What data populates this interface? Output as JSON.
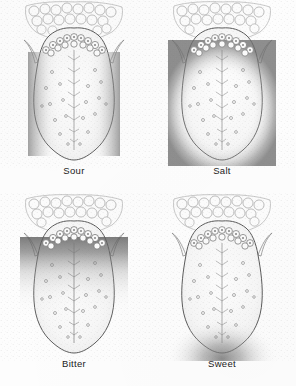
{
  "figure": {
    "background_color": "#fdfdfd",
    "ink_color": "#3a3a3a",
    "label_color": "#1b1b1b",
    "layout": "2x2 grid of dorsal tongue illustrations",
    "panel_count": 4
  },
  "panels": [
    {
      "id": "sour",
      "label": "Sour",
      "shaded_region": "lateral margins (both sides, mid-tongue)",
      "shade_color": "#8f8f8f",
      "position": "top-left"
    },
    {
      "id": "salt",
      "label": "Salt",
      "shaded_region": "anterior perimeter: lateral edges and tip",
      "shade_color": "#8f8f8f",
      "position": "top-right"
    },
    {
      "id": "bitter",
      "label": "Bitter",
      "shaded_region": "posterior tongue behind circumvallate papillae",
      "shade_color": "#6e6e6e",
      "position": "bottom-left"
    },
    {
      "id": "sweet",
      "label": "Sweet",
      "shaded_region": "apex / tip of tongue",
      "shade_color": "#8f8f8f",
      "position": "bottom-right"
    }
  ],
  "anatomy": {
    "lingual_tonsil": "cobblestone lobules across the root of the tongue",
    "circumvallate_papillae": "V-shaped (chevron) row of ringed papillae",
    "median_sulcus": "central vertical groove with herringbone branches",
    "fungiform_papillae": "scattered small circles across the tongue body",
    "lateral_horns": "pointed palatoglossal folds at upper left and right"
  }
}
